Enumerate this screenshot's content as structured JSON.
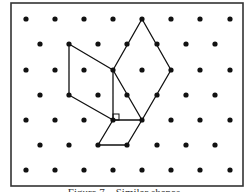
{
  "caption": "Figure 7 – Similar shapes",
  "frame": {
    "x": 11,
    "y": 3,
    "width": 232,
    "height": 183,
    "stroke": "#333333"
  },
  "grid": {
    "dot_radius": 2.6,
    "dot_color": "#111111",
    "rows": [
      {
        "y": 19,
        "xs": [
          26,
          55,
          84,
          113,
          142,
          171,
          200,
          230
        ]
      },
      {
        "y": 44,
        "xs": [
          40,
          69,
          98,
          127,
          157,
          186,
          215
        ]
      },
      {
        "y": 70,
        "xs": [
          26,
          55,
          84,
          113,
          142,
          171,
          200,
          230
        ]
      },
      {
        "y": 95,
        "xs": [
          40,
          69,
          98,
          127,
          157,
          186,
          215
        ]
      },
      {
        "y": 120,
        "xs": [
          26,
          55,
          84,
          113,
          142,
          171,
          200,
          230
        ]
      },
      {
        "y": 145,
        "xs": [
          40,
          69,
          98,
          127,
          157,
          186,
          215
        ]
      },
      {
        "y": 170,
        "xs": [
          26,
          55,
          84,
          113,
          142,
          171,
          200,
          230
        ]
      }
    ]
  },
  "shapes": [
    {
      "name": "left-quadrilateral",
      "points": [
        [
          69,
          44
        ],
        [
          113,
          70
        ],
        [
          113,
          120
        ],
        [
          69,
          95
        ]
      ]
    },
    {
      "name": "right-kite",
      "points": [
        [
          142,
          19
        ],
        [
          171,
          70
        ],
        [
          142,
          120
        ],
        [
          113,
          70
        ]
      ]
    },
    {
      "name": "bottom-parallelogram",
      "points": [
        [
          113,
          120
        ],
        [
          142,
          120
        ],
        [
          127,
          145
        ],
        [
          98,
          145
        ]
      ]
    }
  ],
  "line_color": "#111111",
  "right_angle_marker": {
    "x": 113,
    "y": 114,
    "size": 6
  }
}
